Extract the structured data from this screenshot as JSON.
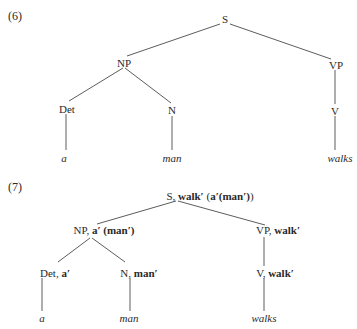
{
  "examples": [
    {
      "number": "(6)",
      "nodes": {
        "S": {
          "label": "S"
        },
        "NP": {
          "label": "NP"
        },
        "VP": {
          "label": "VP"
        },
        "Det": {
          "label": "Det"
        },
        "N": {
          "label": "N"
        },
        "V": {
          "label": "V"
        }
      },
      "leaves": {
        "a": "a",
        "man": "man",
        "walks": "walks"
      }
    },
    {
      "number": "(7)",
      "nodes": {
        "S": {
          "category": "S, ",
          "semantics": "walk′",
          "rest": " (",
          "inner": "a′(man′)",
          "close": ")"
        },
        "NP": {
          "category": "NP, ",
          "semantics": "a′ (man′)"
        },
        "VP": {
          "category": "VP, ",
          "semantics": "walk′"
        },
        "Det": {
          "category": "Det, ",
          "semantics": "a′"
        },
        "N": {
          "category": "N, ",
          "semantics": "man′"
        },
        "V": {
          "category": "V, ",
          "semantics": "walk′"
        }
      },
      "leaves": {
        "a": "a",
        "man": "man",
        "walks": "walks"
      }
    }
  ]
}
